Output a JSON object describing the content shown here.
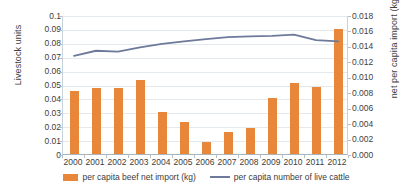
{
  "chart_data": {
    "type": "bar",
    "title": "",
    "xlabel": "",
    "categories": [
      "2000",
      "2001",
      "2002",
      "2003",
      "2004",
      "2005",
      "2006",
      "2007",
      "2008",
      "2009",
      "2010",
      "2011",
      "2012"
    ],
    "grid": "horizontal",
    "legend_position": "bottom",
    "series": [
      {
        "name": "per capita beef net import (kg)",
        "type": "bar",
        "axis": "right",
        "color": "#e8873a",
        "values": [
          0.0082,
          0.0086,
          0.0085,
          0.0096,
          0.0055,
          0.0042,
          0.0015,
          0.0029,
          0.0034,
          0.0072,
          0.0092,
          0.0087,
          0.0162
        ]
      },
      {
        "name": "per capita number of live cattle",
        "type": "line",
        "axis": "left",
        "color": "#6e7a9b",
        "values": [
          0.0713,
          0.075,
          0.0743,
          0.0775,
          0.08,
          0.0818,
          0.0833,
          0.0848,
          0.0853,
          0.0857,
          0.0866,
          0.0827,
          0.0818
        ]
      }
    ],
    "y_left": {
      "label": "Livestock units",
      "min": 0,
      "max": 0.1,
      "step": 0.01,
      "ticks": [
        "0",
        "0.01",
        "0.02",
        "0.03",
        "0.04",
        "0.05",
        "0.06",
        "0.07",
        "0.08",
        "0.09",
        "0.1"
      ]
    },
    "y_right": {
      "label": "net per capita import (kg)",
      "min": 0,
      "max": 0.018,
      "step": 0.002,
      "ticks": [
        "0.000",
        "0.002",
        "0.004",
        "0.006",
        "0.008",
        "0.010",
        "0.012",
        "0.014",
        "0.016",
        "0.018"
      ]
    }
  },
  "legend": {
    "items": [
      {
        "label": "per capita beef net import (kg)",
        "marker": "bar-swatch",
        "color": "#e8873a"
      },
      {
        "label": "per capita number of live cattle",
        "marker": "line-swatch",
        "color": "#6e7a9b"
      }
    ]
  }
}
